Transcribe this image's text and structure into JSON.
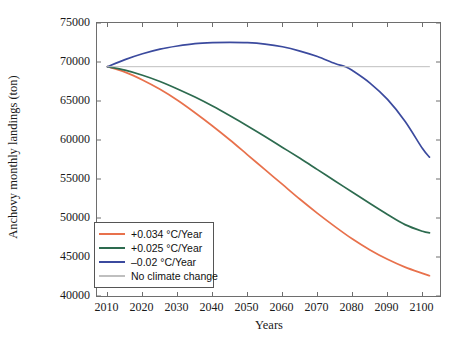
{
  "chart_data": {
    "type": "line",
    "title": "",
    "xlabel": "Years",
    "ylabel": "Anchovy monthly landings (ton)",
    "xlim": [
      2007,
      2105
    ],
    "ylim": [
      40000,
      75000
    ],
    "xticks": [
      2010,
      2020,
      2030,
      2040,
      2050,
      2060,
      2070,
      2080,
      2090,
      2100
    ],
    "yticks": [
      40000,
      45000,
      50000,
      55000,
      60000,
      65000,
      70000,
      75000
    ],
    "grid": false,
    "legend_position": "lower left",
    "series": [
      {
        "name": "+0.034 °C/Year",
        "color": "#E8714C",
        "x": [
          2010,
          2015,
          2020,
          2025,
          2030,
          2035,
          2040,
          2045,
          2050,
          2055,
          2060,
          2065,
          2070,
          2075,
          2080,
          2085,
          2090,
          2095,
          2100,
          2102
        ],
        "values": [
          69400,
          68700,
          67700,
          66500,
          65100,
          63500,
          61800,
          60000,
          58100,
          56200,
          54300,
          52400,
          50600,
          48900,
          47300,
          45900,
          44700,
          43700,
          42900,
          42600
        ]
      },
      {
        "name": "+0.025 °C/Year",
        "color": "#2D6B4F",
        "x": [
          2010,
          2015,
          2020,
          2025,
          2030,
          2035,
          2040,
          2045,
          2050,
          2055,
          2060,
          2065,
          2070,
          2075,
          2080,
          2085,
          2090,
          2095,
          2100,
          2102
        ],
        "values": [
          69400,
          68950,
          68300,
          67500,
          66550,
          65500,
          64350,
          63100,
          61800,
          60450,
          59050,
          57650,
          56200,
          54750,
          53300,
          51850,
          50450,
          49150,
          48300,
          48100
        ]
      },
      {
        "name": "–0.02 °C/Year",
        "color": "#3B4A9E",
        "x": [
          2010,
          2015,
          2020,
          2025,
          2030,
          2035,
          2040,
          2045,
          2050,
          2055,
          2060,
          2065,
          2070,
          2075,
          2078,
          2080,
          2085,
          2090,
          2095,
          2100,
          2102
        ],
        "values": [
          69400,
          70300,
          71050,
          71650,
          72050,
          72350,
          72480,
          72520,
          72480,
          72300,
          71950,
          71400,
          70700,
          69800,
          69400,
          68900,
          67300,
          65200,
          62400,
          58900,
          57800
        ]
      },
      {
        "name": "No climate change",
        "color": "#BFBFBF",
        "x": [
          2010,
          2102
        ],
        "values": [
          69400,
          69400
        ]
      }
    ],
    "legend": [
      {
        "label": "+0.034 °C/Year",
        "color": "#E8714C"
      },
      {
        "label": "+0.025 °C/Year",
        "color": "#2D6B4F"
      },
      {
        "label": "–0.02 °C/Year",
        "color": "#3B4A9E"
      },
      {
        "label": "No climate change",
        "color": "#BFBFBF"
      }
    ]
  }
}
